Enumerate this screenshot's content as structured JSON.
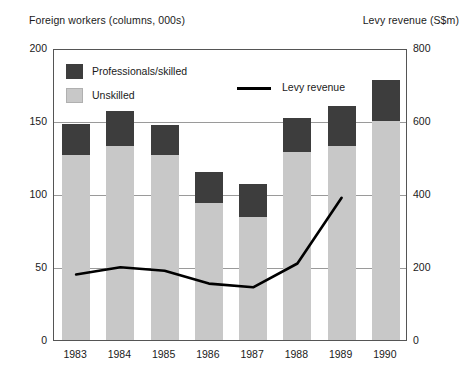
{
  "chart_data": {
    "type": "bar",
    "title": "",
    "subtitle": "",
    "left_axis_title": "Foreign workers (columns, 000s)",
    "right_axis_title": "Levy revenue (S$m)",
    "xlabel": "",
    "categories": [
      "1983",
      "1984",
      "1985",
      "1986",
      "1987",
      "1988",
      "1989",
      "1990"
    ],
    "ylim": [
      0,
      200
    ],
    "yticks": [
      "0",
      "50",
      "100",
      "150",
      "200"
    ],
    "y2lim": [
      0,
      800
    ],
    "y2ticks": [
      "0",
      "200",
      "400",
      "600",
      "800"
    ],
    "grid": true,
    "legend_position": "inside-top-left",
    "series": [
      {
        "name": "Unskilled",
        "type": "bar",
        "stack": "workers",
        "axis": "left",
        "color": "#c8c8c8",
        "values": [
          127,
          133,
          127,
          94,
          84,
          129,
          133,
          150
        ]
      },
      {
        "name": "Professionals/skilled",
        "type": "bar",
        "stack": "workers",
        "axis": "left",
        "color": "#3d3d3d",
        "values": [
          21,
          24,
          20,
          21,
          23,
          23,
          27,
          28
        ]
      },
      {
        "name": "Levy revenue",
        "type": "line",
        "axis": "right",
        "color": "#000000",
        "x": [
          "1983",
          "1984",
          "1985",
          "1986",
          "1987",
          "1988",
          "1989"
        ],
        "values": [
          185,
          205,
          195,
          160,
          150,
          215,
          395
        ]
      }
    ],
    "stack_totals": [
      148,
      157,
      147,
      115,
      107,
      152,
      160,
      178
    ]
  },
  "legend": {
    "skilled_label": "Professionals/skilled",
    "unskilled_label": "Unskilled",
    "line_label": "Levy revenue"
  }
}
